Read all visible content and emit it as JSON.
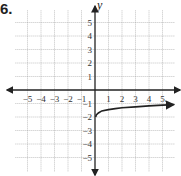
{
  "problem_number": "6.",
  "chart_data": {
    "type": "line",
    "title": "",
    "xlabel": "x",
    "ylabel": "y",
    "xlim": [
      -6,
      6
    ],
    "ylim": [
      -6,
      6
    ],
    "grid": true,
    "x_tick_labels": [
      "-5",
      "-4",
      "-3",
      "-2",
      "-1",
      "1",
      "2",
      "3",
      "4",
      "5"
    ],
    "y_tick_labels": [
      "5",
      "4",
      "3",
      "2",
      "1",
      "-1",
      "-2",
      "-3",
      "-4",
      "-5"
    ],
    "series": [
      {
        "name": "curve",
        "x": [
          0.05,
          0.1,
          0.25,
          0.5,
          1,
          1.5,
          2,
          3,
          4,
          5,
          5.8
        ],
        "y": [
          -2.0,
          -1.85,
          -1.7,
          -1.55,
          -1.45,
          -1.38,
          -1.32,
          -1.25,
          -1.18,
          -1.12,
          -1.08
        ],
        "end_arrow": true
      }
    ]
  },
  "colors": {
    "grid": "#9a9a9a",
    "axis": "#222222",
    "curve": "#222222"
  }
}
